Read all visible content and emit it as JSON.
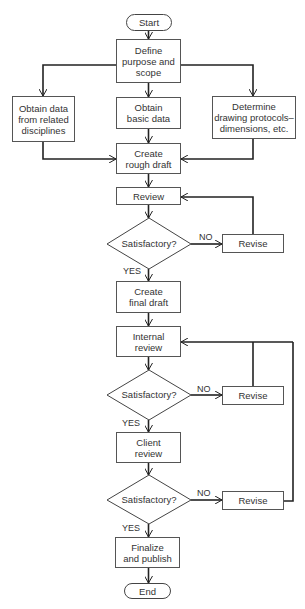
{
  "diagram": {
    "type": "flowchart",
    "nodes": {
      "start": "Start",
      "define": "Define purpose and scope",
      "obtain_related": "Obtain data from related disciplines",
      "obtain_basic": "Obtain basic data",
      "determine": "Determine drawing protocols–dimensions, etc.",
      "rough_draft": "Create rough draft",
      "review": "Review",
      "decision1": "Satisfactory?",
      "revise1": "Revise",
      "final_draft": "Create final draft",
      "internal_review": "Internal review",
      "decision2": "Satisfactory?",
      "revise2": "Revise",
      "client_review": "Client review",
      "decision3": "Satisfactory?",
      "revise3": "Revise",
      "finalize": "Finalize and publish",
      "end": "End"
    },
    "lines": {
      "define_l1": "Define",
      "define_l2": "purpose and",
      "define_l3": "scope",
      "related_l1": "Obtain data",
      "related_l2": "from related",
      "related_l3": "disciplines",
      "basic_l1": "Obtain",
      "basic_l2": "basic data",
      "determine_l1": "Determine",
      "determine_l2": "drawing protocols–",
      "determine_l3": "dimensions, etc.",
      "rough_l1": "Create",
      "rough_l2": "rough draft",
      "final_l1": "Create",
      "final_l2": "final draft",
      "internal_l1": "Internal",
      "internal_l2": "review",
      "client_l1": "Client",
      "client_l2": "review",
      "finalize_l1": "Finalize",
      "finalize_l2": "and publish"
    },
    "edge_labels": {
      "yes": "YES",
      "no": "NO"
    },
    "edges": [
      [
        "start",
        "define"
      ],
      [
        "define",
        "obtain_related"
      ],
      [
        "define",
        "obtain_basic"
      ],
      [
        "define",
        "determine"
      ],
      [
        "obtain_related",
        "rough_draft"
      ],
      [
        "obtain_basic",
        "rough_draft"
      ],
      [
        "determine",
        "rough_draft"
      ],
      [
        "rough_draft",
        "review"
      ],
      [
        "review",
        "decision1"
      ],
      [
        "decision1",
        "revise1",
        "NO"
      ],
      [
        "revise1",
        "review"
      ],
      [
        "decision1",
        "final_draft",
        "YES"
      ],
      [
        "final_draft",
        "internal_review"
      ],
      [
        "internal_review",
        "decision2"
      ],
      [
        "decision2",
        "revise2",
        "NO"
      ],
      [
        "revise2",
        "internal_review"
      ],
      [
        "decision2",
        "client_review",
        "YES"
      ],
      [
        "client_review",
        "decision3"
      ],
      [
        "decision3",
        "revise3",
        "NO"
      ],
      [
        "revise3",
        "internal_review"
      ],
      [
        "decision3",
        "finalize",
        "YES"
      ],
      [
        "finalize",
        "end"
      ]
    ]
  }
}
